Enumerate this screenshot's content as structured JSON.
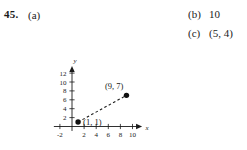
{
  "exercise": {
    "number": "45.",
    "parts": [
      {
        "key": "a",
        "label": "(a)",
        "value": ""
      },
      {
        "key": "b",
        "label": "(b)",
        "value": "10"
      },
      {
        "key": "c",
        "label": "(c)",
        "value": "(5, 4)"
      }
    ]
  },
  "chart_data": {
    "type": "scatter",
    "title": "",
    "xlabel": "x",
    "ylabel": "y",
    "xlim": [
      -3,
      11.5
    ],
    "ylim": [
      -1,
      13.5
    ],
    "xticks": [
      -2,
      2,
      4,
      6,
      8,
      10
    ],
    "xticklabels": [
      "-2",
      "2",
      "4",
      "6",
      "8",
      "10"
    ],
    "yticks": [
      2,
      4,
      6,
      8,
      10,
      12
    ],
    "yticklabels": [
      "2",
      "4",
      "6",
      "8",
      "10",
      "12"
    ],
    "grid": false,
    "legend": null,
    "points": [
      {
        "x": 1,
        "y": 1,
        "label": "(1, 1)",
        "label_position": "right"
      },
      {
        "x": 9,
        "y": 7,
        "label": "(9, 7)",
        "label_position": "above-left"
      }
    ],
    "series": [
      {
        "name": "segment",
        "style": "dashed",
        "x": [
          1,
          9
        ],
        "y": [
          1,
          7
        ]
      }
    ],
    "colors": {
      "axis": "#1a1a1a",
      "point": "#111111",
      "line": "#1a1a1a",
      "background": "#ffffff"
    }
  }
}
